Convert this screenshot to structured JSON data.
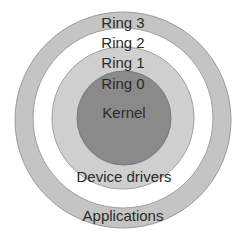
{
  "diagram": {
    "type": "concentric-rings",
    "rings": [
      {
        "id": "ring3",
        "label": "Ring 3",
        "content": "Applications",
        "color": "#c4c4c4"
      },
      {
        "id": "ring2",
        "label": "Ring 2",
        "content": "",
        "color": "#ffffff"
      },
      {
        "id": "ring1",
        "label": "Ring 1",
        "content": "Device drivers",
        "color": "#cfcfcf"
      },
      {
        "id": "ring0",
        "label": "Ring 0",
        "content": "Kernel",
        "color": "#8a8a8a"
      }
    ],
    "outline_color": "#999999",
    "text_color": "#2a2a2a"
  }
}
